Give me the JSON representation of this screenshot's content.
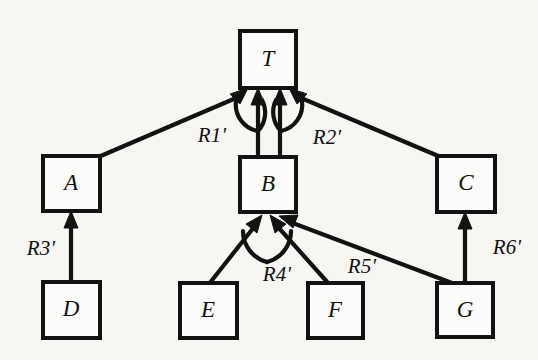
{
  "figure": {
    "kind": "directed-graph-diagram",
    "background_color": "#f7f6f3",
    "line_color": "#121212",
    "node_fill_color": "#fdfcfa",
    "width": 538,
    "height": 360
  },
  "nodes": [
    {
      "id": "T",
      "label": "T",
      "x": 240,
      "y": 31,
      "w": 56,
      "h": 57
    },
    {
      "id": "A",
      "label": "A",
      "x": 43,
      "y": 156,
      "w": 57,
      "h": 55
    },
    {
      "id": "B",
      "label": "B",
      "x": 240,
      "y": 157,
      "w": 56,
      "h": 55
    },
    {
      "id": "C",
      "label": "C",
      "x": 437,
      "y": 156,
      "w": 58,
      "h": 56
    },
    {
      "id": "D",
      "label": "D",
      "x": 43,
      "y": 282,
      "w": 57,
      "h": 56
    },
    {
      "id": "E",
      "label": "E",
      "x": 180,
      "y": 283,
      "w": 57,
      "h": 55
    },
    {
      "id": "F",
      "label": "F",
      "x": 308,
      "y": 283,
      "w": 55,
      "h": 55
    },
    {
      "id": "G",
      "label": "G",
      "x": 437,
      "y": 283,
      "w": 56,
      "h": 54
    }
  ],
  "edges": [
    {
      "id": "e-A-T",
      "from": "A",
      "to": "T",
      "label": null
    },
    {
      "id": "e-B-T-1",
      "from": "B",
      "to": "T",
      "label": null
    },
    {
      "id": "e-B-T-2",
      "from": "B",
      "to": "T",
      "label": null
    },
    {
      "id": "e-C-T",
      "from": "C",
      "to": "T",
      "label": null
    },
    {
      "id": "e-D-A",
      "from": "D",
      "to": "A",
      "label": "R3'"
    },
    {
      "id": "e-E-B",
      "from": "E",
      "to": "B",
      "label": null
    },
    {
      "id": "e-F-B",
      "from": "F",
      "to": "B",
      "label": null
    },
    {
      "id": "e-G-B",
      "from": "G",
      "to": "B",
      "label": "R5'"
    },
    {
      "id": "e-G-C",
      "from": "G",
      "to": "C",
      "label": "R6'"
    }
  ],
  "relation_arcs": [
    {
      "id": "arc-R1",
      "label": "R1'",
      "joins": [
        "e-A-T",
        "e-B-T-1"
      ],
      "label_x": 212,
      "label_y": 137
    },
    {
      "id": "arc-R2",
      "label": "R2'",
      "joins": [
        "e-B-T-2",
        "e-C-T"
      ],
      "label_x": 327,
      "label_y": 139
    },
    {
      "id": "arc-R4",
      "label": "R4'",
      "joins": [
        "e-E-B",
        "e-F-B"
      ],
      "label_x": 277,
      "label_y": 276
    }
  ],
  "labels": {
    "R1": "R1'",
    "R2": "R2'",
    "R3": "R3'",
    "R4": "R4'",
    "R5": "R5'",
    "R6": "R6'"
  },
  "label_positions": {
    "R3": {
      "x": 41,
      "y": 250
    },
    "R5": {
      "x": 362,
      "y": 268
    },
    "R6": {
      "x": 507,
      "y": 249
    }
  }
}
